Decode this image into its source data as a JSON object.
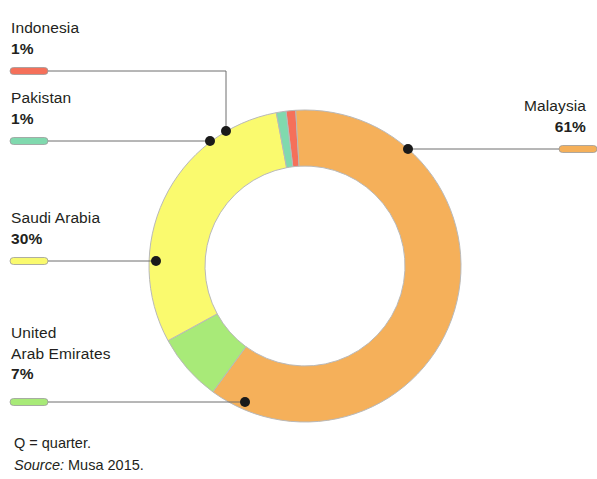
{
  "chart_data": {
    "type": "pie",
    "variant": "donut",
    "title": "",
    "subtitle": "",
    "xlabel": "",
    "ylabel": "",
    "legend_position": "callout-labels",
    "grid": false,
    "total_label": "",
    "categories": [
      "Malaysia",
      "Indonesia",
      "Pakistan",
      "Saudi Arabia",
      "United Arab Emirates"
    ],
    "values": [
      61,
      1,
      1,
      30,
      7
    ],
    "value_unit": "%",
    "slices": [
      {
        "name": "Indonesia",
        "value": 1,
        "value_label": "1%",
        "color": "#f5705a"
      },
      {
        "name": "Malaysia",
        "value": 61,
        "value_label": "61%",
        "color": "#f5b05a"
      },
      {
        "name": "United Arab Emirates",
        "value": 7,
        "value_label": "7%",
        "color": "#a8ea78"
      },
      {
        "name": "Saudi Arabia",
        "value": 30,
        "value_label": "30%",
        "color": "#fafa6e"
      },
      {
        "name": "Pakistan",
        "value": 1,
        "value_label": "1%",
        "color": "#80d9ae"
      }
    ]
  },
  "labels": {
    "indonesia": {
      "name": "Indonesia",
      "pct": "1%",
      "color": "#f5705a"
    },
    "pakistan": {
      "name": "Pakistan",
      "pct": "1%",
      "color": "#80d9ae"
    },
    "saudi_arabia": {
      "name": "Saudi Arabia",
      "pct": "30%",
      "color": "#fafa6e"
    },
    "uae": {
      "name_line1": "United",
      "name_line2": "Arab Emirates",
      "pct": "7%",
      "color": "#a8ea78"
    },
    "malaysia": {
      "name": "Malaysia",
      "pct": "61%",
      "color": "#f5b05a"
    }
  },
  "footnotes": {
    "quarter_note": "Q = quarter.",
    "source_prefix": "Source:",
    "source_text": "Musa 2015."
  },
  "colors": {
    "malaysia": "#f5b05a",
    "saudi_arabia": "#fafa6e",
    "uae": "#a8ea78",
    "pakistan": "#80d9ae",
    "indonesia": "#f5705a",
    "leader_line": "#6e6e6e",
    "dot": "#1a1a1a",
    "text": "#231f20",
    "slice_stroke": "#b9b9b9",
    "background": "#ffffff"
  }
}
